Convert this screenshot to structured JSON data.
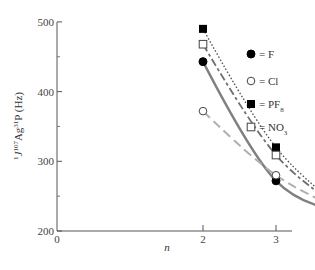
{
  "chart_data": {
    "type": "line",
    "title": "",
    "xlabel": "n",
    "ylabel": "1J107Ag31P (Hz)",
    "ylabel_parts": {
      "pre_sup": "1",
      "J": "J",
      "mass_sup": "107",
      "elem1": "Ag",
      "p_sup": "31",
      "elem2": "P",
      "unit": " (Hz)"
    },
    "x": [
      2,
      3,
      4
    ],
    "xlim": [
      0,
      4.25
    ],
    "ylim": [
      200,
      500
    ],
    "x_ticks": [
      "0",
      "2",
      "3",
      "4"
    ],
    "y_ticks": [
      "200",
      "300",
      "400",
      "500"
    ],
    "grid": false,
    "legend_position": "upper right",
    "series": [
      {
        "name": "F",
        "label": "= F",
        "marker": "filled-circle",
        "line": "solid",
        "color": "#808080",
        "values": [
          443,
          272,
          226
        ]
      },
      {
        "name": "Cl",
        "label": "= Cl",
        "marker": "open-circle",
        "line": "dashed",
        "color": "#b0b0b0",
        "values": [
          372,
          280,
          226
        ]
      },
      {
        "name": "PF8",
        "label": "= PF",
        "sub": "8",
        "marker": "filled-square",
        "line": "dotted",
        "color": "#555555",
        "values": [
          490,
          320,
          226
        ]
      },
      {
        "name": "NO3",
        "label": "= NO",
        "sub": "3",
        "marker": "open-square",
        "line": "dash-dot",
        "color": "#707070",
        "values": [
          468,
          309,
          226
        ]
      }
    ]
  }
}
